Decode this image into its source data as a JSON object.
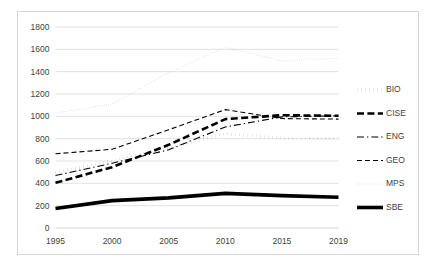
{
  "chart_data": {
    "type": "line",
    "title": "",
    "subtitle": "",
    "xlabel": "",
    "ylabel": "",
    "x": [
      1995,
      2000,
      2005,
      2010,
      2015,
      2019
    ],
    "xtick_labels": [
      "1995",
      "2000",
      "2005",
      "2010",
      "2015",
      "2019"
    ],
    "ytick_labels": [
      "0",
      "200",
      "400",
      "600",
      "800",
      "1000",
      "1200",
      "1400",
      "1600",
      "1800"
    ],
    "ylim": [
      0,
      1800
    ],
    "ytick_step": 200,
    "xlim": [
      1995,
      2019
    ],
    "grid": "horizontal",
    "legend_position": "right",
    "series": [
      {
        "name": "BIO",
        "style": "dotted",
        "values": [
          500,
          600,
          720,
          845,
          805,
          800
        ]
      },
      {
        "name": "CISE",
        "style": "dashed-thick",
        "values": [
          405,
          545,
          745,
          975,
          1010,
          1005
        ]
      },
      {
        "name": "ENG",
        "style": "dash-dot",
        "values": [
          470,
          580,
          700,
          905,
          995,
          1005
        ]
      },
      {
        "name": "GEO",
        "style": "dashed",
        "values": [
          665,
          705,
          880,
          1060,
          980,
          975
        ]
      },
      {
        "name": "MPS",
        "style": "fine-dotted",
        "values": [
          1030,
          1110,
          1390,
          1620,
          1495,
          1520
        ]
      },
      {
        "name": "SBE",
        "style": "solid-thick",
        "values": [
          175,
          245,
          270,
          310,
          290,
          275
        ]
      }
    ]
  },
  "legend": {
    "entries": [
      {
        "label": "BIO"
      },
      {
        "label": "CISE"
      },
      {
        "label": "ENG"
      },
      {
        "label": "GEO"
      },
      {
        "label": "MPS"
      },
      {
        "label": "SBE"
      }
    ]
  },
  "colors": {
    "series": "#000000",
    "grid": "#d9d9d9",
    "axis": "#d0d0d0",
    "text": "#3f3f3f",
    "border": "#d4d4d4",
    "background": "#ffffff"
  }
}
